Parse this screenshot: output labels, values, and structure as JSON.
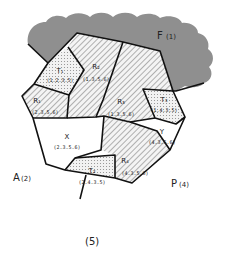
{
  "diagram": {
    "outer_regions": {
      "F": {
        "label": "F",
        "index": "(1)"
      },
      "A": {
        "label": "A",
        "index": "(2)"
      },
      "P": {
        "label": "P",
        "index": "(4)"
      },
      "bottom": {
        "label": "(5)"
      }
    },
    "cells": {
      "T1": {
        "label": "T₁",
        "code": "(1.2.3.5)",
        "fill": "dotted"
      },
      "R2": {
        "label": "R₂",
        "code": "(1.3.5.6)",
        "fill": "hatched"
      },
      "R1": {
        "label": "R₁",
        "code": "(2.3.5.6)",
        "fill": "hatched"
      },
      "R3": {
        "label": "R₃",
        "code": "(1.3.5.6)",
        "fill": "hatched"
      },
      "T3": {
        "label": "T₃",
        "code": "(1.4.3.5)",
        "fill": "dotted"
      },
      "X": {
        "label": "X",
        "code": "(2.3.5.6)",
        "fill": "none"
      },
      "Y": {
        "label": "Y",
        "code": "(4.3.5.6)",
        "fill": "none"
      },
      "R4": {
        "label": "R₄",
        "code": "(4.3.5.6)",
        "fill": "hatched"
      },
      "T2": {
        "label": "T₂",
        "code": "(2.4.3.5)",
        "fill": "dotted"
      }
    },
    "colors": {
      "cloud": "#8f8f8f",
      "edge": "#111111",
      "hatch": "#9a9a9a",
      "dots": "#9a9a9a"
    }
  }
}
